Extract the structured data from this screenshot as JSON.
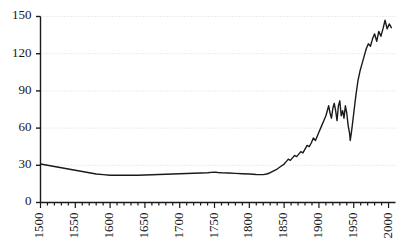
{
  "chart_data": {
    "type": "line",
    "title": "",
    "subtitle": "",
    "xlabel": "",
    "ylabel": "",
    "xlim": [
      1500,
      2010
    ],
    "ylim": [
      0,
      150
    ],
    "grid": true,
    "legend": null,
    "y_ticks": [
      0,
      30,
      60,
      90,
      120,
      150
    ],
    "x_ticks": [
      1500,
      1550,
      1600,
      1650,
      1700,
      1750,
      1800,
      1850,
      1900,
      1950,
      2000
    ],
    "x_minor_tick_step": 10,
    "line_color": "#1a1a1a",
    "grid_color": "#d8d8d8",
    "axis_color": "#1a1a1a",
    "series": [
      {
        "name": "series-1",
        "x": [
          1500,
          1510,
          1520,
          1530,
          1540,
          1550,
          1560,
          1570,
          1580,
          1590,
          1600,
          1610,
          1620,
          1630,
          1640,
          1650,
          1660,
          1670,
          1680,
          1690,
          1700,
          1710,
          1720,
          1730,
          1740,
          1745,
          1750,
          1755,
          1760,
          1770,
          1780,
          1790,
          1800,
          1805,
          1810,
          1815,
          1820,
          1825,
          1830,
          1835,
          1840,
          1845,
          1850,
          1853,
          1856,
          1859,
          1862,
          1865,
          1868,
          1871,
          1874,
          1877,
          1880,
          1883,
          1886,
          1889,
          1892,
          1895,
          1898,
          1901,
          1904,
          1907,
          1910,
          1912,
          1914,
          1916,
          1918,
          1920,
          1922,
          1924,
          1926,
          1928,
          1930,
          1932,
          1934,
          1936,
          1938,
          1940,
          1942,
          1944,
          1945,
          1947,
          1950,
          1953,
          1956,
          1959,
          1962,
          1965,
          1968,
          1971,
          1974,
          1977,
          1980,
          1983,
          1986,
          1989,
          1992,
          1995,
          1998,
          2001,
          2004
        ],
        "y": [
          31,
          30,
          29,
          28,
          27,
          26,
          25,
          24,
          23,
          22.5,
          22,
          22,
          22,
          22,
          22,
          22.2,
          22.4,
          22.6,
          22.8,
          23,
          23.2,
          23.4,
          23.6,
          23.8,
          24,
          24.3,
          24.5,
          24.2,
          24,
          23.8,
          23.5,
          23.2,
          23,
          22.8,
          22.6,
          22.5,
          22.5,
          23,
          24,
          25.5,
          27,
          29,
          31,
          33,
          35,
          34,
          36,
          38,
          37,
          39,
          41,
          40,
          43,
          46,
          45,
          48,
          52,
          50,
          54,
          58,
          62,
          66,
          70,
          74,
          78,
          72,
          68,
          76,
          80,
          74,
          66,
          78,
          82,
          70,
          74,
          68,
          78,
          72,
          62,
          56,
          50,
          58,
          72,
          86,
          98,
          106,
          112,
          118,
          124,
          128,
          126,
          132,
          136,
          130,
          138,
          134,
          140,
          147,
          140,
          144,
          141
        ]
      }
    ]
  },
  "axes": {
    "y_tick_labels": [
      "0",
      "30",
      "60",
      "90",
      "120",
      "150"
    ],
    "x_tick_labels": [
      "1500",
      "1550",
      "1600",
      "1650",
      "1700",
      "1750",
      "1800",
      "1850",
      "1900",
      "1950",
      "2000"
    ]
  }
}
